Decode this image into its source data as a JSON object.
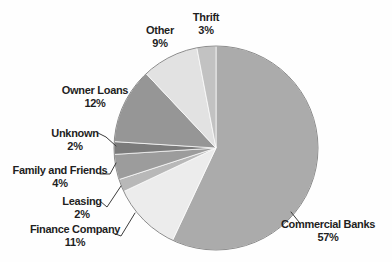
{
  "chart_data": {
    "type": "pie",
    "title": "",
    "legend_position": "none",
    "label_style": "callout",
    "start_angle_deg": -90,
    "direction": "clockwise",
    "outline_color": "#8c8c8c",
    "separator_color": "#ffffff",
    "background_color": "#fefefe",
    "text_color": "#1f1f1f",
    "slices": [
      {
        "id": "commercial-banks",
        "label": "Commercial Banks",
        "value": 57,
        "pct_label": "57%",
        "color": "#ababab"
      },
      {
        "id": "finance-company",
        "label": "Finance Company",
        "value": 11,
        "pct_label": "11%",
        "color": "#ececec"
      },
      {
        "id": "leasing",
        "label": "Leasing",
        "value": 2,
        "pct_label": "2%",
        "color": "#b8b8b8"
      },
      {
        "id": "family-and-friends",
        "label": "Family and Friends",
        "value": 4,
        "pct_label": "4%",
        "color": "#9c9c9c"
      },
      {
        "id": "unknown",
        "label": "Unknown",
        "value": 2,
        "pct_label": "2%",
        "color": "#7b7b7b"
      },
      {
        "id": "owner-loans",
        "label": "Owner Loans",
        "value": 12,
        "pct_label": "12%",
        "color": "#969696"
      },
      {
        "id": "other",
        "label": "Other",
        "value": 9,
        "pct_label": "9%",
        "color": "#e2e2e2"
      },
      {
        "id": "thrift",
        "label": "Thrift",
        "value": 3,
        "pct_label": "3%",
        "color": "#c2c2c2"
      }
    ]
  }
}
